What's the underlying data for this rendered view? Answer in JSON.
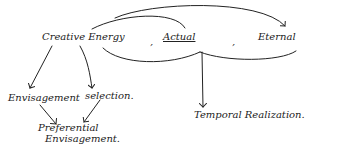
{
  "diagram": {
    "nodes": {
      "creative_energy": "Creative Energy",
      "sep1": ",",
      "actual": "Actual",
      "sep2": ",",
      "eternal": "Eternal",
      "envisagement": "Envisagement",
      "selection": "selection.",
      "preferential_line1": "Preferential",
      "preferential_line2": "Envisagement.",
      "temporal_realization": "Temporal Realization."
    },
    "edges": [
      {
        "from": "creative_energy",
        "to": "eternal",
        "type": "arc"
      },
      {
        "from": "creative_energy",
        "to": "actual",
        "type": "arc"
      },
      {
        "from": "creative_energy",
        "to": "envisagement",
        "type": "arrow"
      },
      {
        "from": "creative_energy",
        "to": "selection",
        "type": "arrow"
      },
      {
        "from": "envisagement",
        "to": "preferential_envisagement",
        "type": "arrow"
      },
      {
        "from": "selection",
        "to": "preferential_envisagement",
        "type": "arrow"
      },
      {
        "from": "actual_eternal_bracket",
        "to": "temporal_realization",
        "type": "arrow"
      }
    ],
    "stroke_color": "#222222"
  }
}
